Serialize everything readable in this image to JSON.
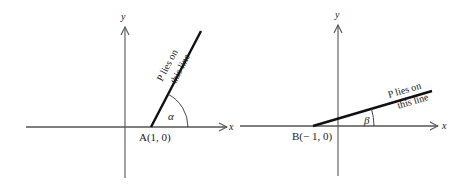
{
  "figure_left": {
    "axis_x_label": "x",
    "axis_y_label": "y",
    "point_label": "A(1, 0)",
    "angle_label": "α",
    "line_text_top": "P lies on",
    "line_text_bottom": "this line"
  },
  "figure_right": {
    "axis_x_label": "x",
    "axis_y_label": "y",
    "point_label": "B(− 1, 0)",
    "angle_label": "β",
    "line_text_top": "P lies on",
    "line_text_bottom": "this line"
  },
  "colors": {
    "axis": "#555555",
    "line": "#111111",
    "text": "#222222"
  }
}
